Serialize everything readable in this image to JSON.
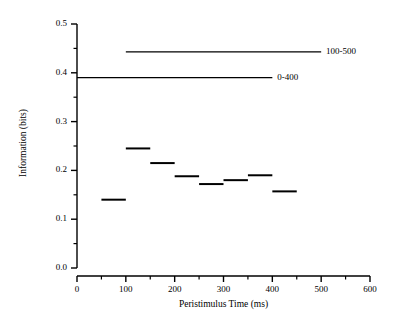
{
  "chart_data": {
    "type": "line",
    "title": "",
    "xlabel": "Peristimulus Time (ms)",
    "ylabel": "Information (bits)",
    "xlim": [
      0,
      600
    ],
    "ylim": [
      0.0,
      0.5
    ],
    "grid": false,
    "legend_position": "inline-right",
    "x_ticks": [
      {
        "value": 0,
        "label": "0"
      },
      {
        "value": 100,
        "label": "100"
      },
      {
        "value": 200,
        "label": "200"
      },
      {
        "value": 300,
        "label": "300"
      },
      {
        "value": 400,
        "label": "400"
      },
      {
        "value": 500,
        "label": "500"
      },
      {
        "value": 600,
        "label": "600"
      }
    ],
    "x_minor_ticks": [
      50,
      150,
      250,
      350,
      450,
      550
    ],
    "y_ticks": [
      {
        "value": 0.0,
        "label": "0.0"
      },
      {
        "value": 0.1,
        "label": "0.1"
      },
      {
        "value": 0.2,
        "label": "0.2"
      },
      {
        "value": 0.3,
        "label": "0.3"
      },
      {
        "value": 0.4,
        "label": "0.4"
      },
      {
        "value": 0.5,
        "label": "0.5"
      }
    ],
    "y_minor_ticks": [
      0.05,
      0.15,
      0.25,
      0.35,
      0.45
    ],
    "series": [
      {
        "name": "sliding-window",
        "style": "step-segments",
        "segments": [
          {
            "x_start": 50,
            "x_end": 100,
            "value": 0.14
          },
          {
            "x_start": 100,
            "x_end": 150,
            "value": 0.245
          },
          {
            "x_start": 150,
            "x_end": 200,
            "value": 0.215
          },
          {
            "x_start": 200,
            "x_end": 250,
            "value": 0.188
          },
          {
            "x_start": 250,
            "x_end": 300,
            "value": 0.172
          },
          {
            "x_start": 300,
            "x_end": 350,
            "value": 0.18
          },
          {
            "x_start": 350,
            "x_end": 400,
            "value": 0.19
          },
          {
            "x_start": 400,
            "x_end": 450,
            "value": 0.157
          }
        ]
      },
      {
        "name": "100-500",
        "style": "horizontal-line",
        "label": "100-500",
        "x_start": 100,
        "x_end": 500,
        "value": 0.443
      },
      {
        "name": "0-400",
        "style": "horizontal-line",
        "label": "0-400",
        "x_start": 0,
        "x_end": 400,
        "value": 0.39
      }
    ],
    "annotations": [
      {
        "text": "100-500",
        "x": 510,
        "value": 0.443
      },
      {
        "text": "0-400",
        "x": 410,
        "value": 0.39
      }
    ]
  },
  "colors": {
    "background": "#ffffff",
    "axis": "#000000",
    "data": "#000000"
  }
}
